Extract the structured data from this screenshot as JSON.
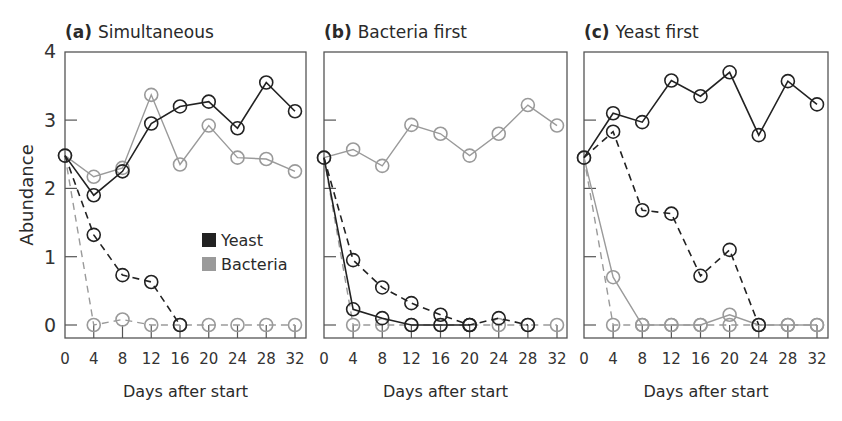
{
  "chart_data": {
    "type": "line",
    "ylabel": "Abundance",
    "xlabel": "Days after start",
    "ylim": [
      -0.2,
      4
    ],
    "yticks": [
      0,
      1,
      2,
      3,
      4
    ],
    "x": [
      0,
      4,
      8,
      12,
      16,
      20,
      24,
      28,
      32
    ],
    "xtick_labels": [
      "0",
      "4",
      "8",
      "12",
      "16",
      "20",
      "24",
      "28",
      "32"
    ],
    "grid": false,
    "legend": {
      "position": "inside panel (a), lower right",
      "entries": [
        {
          "label": "Yeast",
          "color": "#222222"
        },
        {
          "label": "Bacteria",
          "color": "#9a9a9a"
        }
      ]
    },
    "colors": {
      "yeast": "#222222",
      "bacteria": "#9a9a9a",
      "axis": "#555555"
    },
    "panels": [
      {
        "tag": "(a)",
        "title": "Simultaneous",
        "series": [
          {
            "name": "Yeast",
            "style": "solid",
            "values": [
              2.48,
              1.9,
              2.25,
              2.95,
              3.2,
              3.27,
              2.88,
              3.55,
              3.13
            ]
          },
          {
            "name": "Bacteria",
            "style": "solid",
            "values": [
              2.48,
              2.17,
              2.3,
              3.37,
              2.35,
              2.92,
              2.45,
              2.43,
              2.25
            ]
          },
          {
            "name": "Yeast",
            "style": "dashed",
            "values": [
              2.48,
              1.32,
              0.73,
              0.63,
              0,
              null,
              null,
              null,
              null
            ]
          },
          {
            "name": "Bacteria",
            "style": "dashed",
            "values": [
              2.48,
              0,
              0.08,
              0,
              0,
              0,
              0,
              0,
              0
            ]
          }
        ]
      },
      {
        "tag": "(b)",
        "title": "Bacteria first",
        "series": [
          {
            "name": "Bacteria",
            "style": "solid",
            "values": [
              2.45,
              2.57,
              2.33,
              2.93,
              2.8,
              2.48,
              2.8,
              3.22,
              2.92
            ]
          },
          {
            "name": "Yeast",
            "style": "solid",
            "values": [
              2.45,
              0.23,
              0.1,
              0,
              0,
              0,
              null,
              null,
              null
            ]
          },
          {
            "name": "Yeast",
            "style": "dashed",
            "values": [
              2.45,
              0.95,
              0.55,
              0.32,
              0.15,
              0,
              0.1,
              0,
              null
            ]
          },
          {
            "name": "Bacteria",
            "style": "dashed",
            "values": [
              2.45,
              0,
              0,
              0,
              0,
              0,
              0,
              0,
              0
            ]
          }
        ]
      },
      {
        "tag": "(c)",
        "title": "Yeast first",
        "series": [
          {
            "name": "Yeast",
            "style": "solid",
            "values": [
              2.45,
              3.1,
              2.97,
              3.58,
              3.35,
              3.7,
              2.78,
              3.57,
              3.23
            ]
          },
          {
            "name": "Yeast",
            "style": "dashed",
            "values": [
              2.45,
              2.83,
              1.68,
              1.63,
              0.72,
              1.1,
              0,
              null,
              null
            ]
          },
          {
            "name": "Bacteria",
            "style": "solid",
            "values": [
              2.45,
              0.7,
              0,
              0,
              0,
              0.15,
              0,
              0,
              0
            ]
          },
          {
            "name": "Bacteria",
            "style": "dashed",
            "values": [
              2.45,
              0,
              0,
              0,
              0,
              0,
              0,
              0,
              0
            ]
          }
        ]
      }
    ]
  }
}
